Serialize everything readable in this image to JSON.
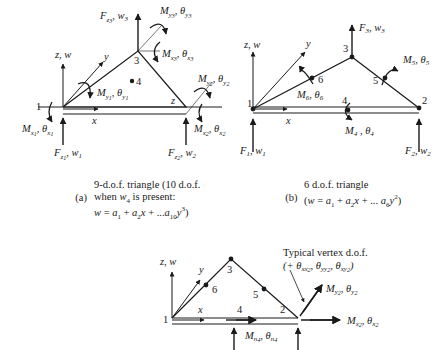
{
  "panel_a": {
    "axis_z": "z, w",
    "axis_y": "y",
    "axis_x": "x",
    "corner_z": "z",
    "nodes": [
      "1",
      "2",
      "3",
      "4"
    ],
    "labels": {
      "Fz1": "F",
      "Fz1_sub": "z1",
      "Fz1_rest": ", w1",
      "Fz2": "F",
      "Fz2_sub": "z2",
      "Fz2_rest": ", w2",
      "Fz3": "F",
      "Fz3_sub": "z3",
      "Fz3_rest": ", w3",
      "Mx1": "Mx1, θx1",
      "My1": "My1, θy1",
      "Mx2": "Mx2, θx2",
      "My2": "My2, θy2",
      "Mx3": "Mx3, θx3",
      "My3": "My3, θy3"
    },
    "caption": {
      "tag": "(a)",
      "line1": "9-d.o.f. triangle (10 d.o.f.",
      "line2": "when w4 is present:",
      "line3": "w = a1 + a2x + ...a10y3)"
    }
  },
  "panel_b": {
    "axis_z": "z, w",
    "axis_y": "y",
    "axis_x": "x",
    "nodes": [
      "1",
      "2",
      "3",
      "4",
      "5",
      "6"
    ],
    "labels": {
      "F1": "F1, w1",
      "F2": "F2, w2",
      "F3": "F3, w3",
      "M4": "M4 , θ4",
      "M5": "M5, θ5",
      "M6": "M6, θ6"
    },
    "caption": {
      "tag": "(b)",
      "line1": "6 d.o.f. triangle",
      "line2": "(w = a1 + a2x + ... a6y2)"
    }
  },
  "panel_c": {
    "axis_z": "z, w",
    "axis_y": "y",
    "axis_x": "x",
    "nodes": [
      "1",
      "2",
      "3",
      "4",
      "5",
      "6"
    ],
    "labels": {
      "Mn4": "Mn4, θn4",
      "My2": "My2, θy2",
      "Mx2": "Mx2, θx2"
    },
    "annotation": {
      "line1": "Typical vertex d.o.f.",
      "line2": "(+ θxx2, θyy2, θxy2)"
    }
  },
  "colors": {
    "ink": "#1a1a1a",
    "background": "#ffffff"
  }
}
